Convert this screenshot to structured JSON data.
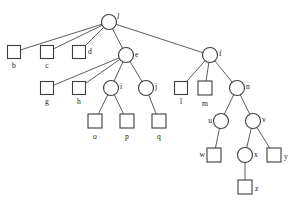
{
  "diagram": {
    "type": "tree-diagram",
    "canvas": {
      "width": 295,
      "height": 201
    },
    "style": {
      "background": "#ffffff",
      "edge_color": "#4a4a4a",
      "node_stroke": "#3d3d3d",
      "node_fill": "#ffffff",
      "label_color": "#1a1a1a"
    },
    "nodes": [
      {
        "id": "a",
        "label": "l",
        "shape": "circle",
        "x": 109,
        "y": 22,
        "r": 7.5,
        "label_pos": "right",
        "label_dx": 8,
        "label_dy": -5,
        "italic": true
      },
      {
        "id": "b",
        "label": "b",
        "shape": "square",
        "x": 14,
        "y": 52,
        "s": 13,
        "label_pos": "below",
        "label_dx": 0,
        "label_dy": 13
      },
      {
        "id": "c",
        "label": "c",
        "shape": "square",
        "x": 47,
        "y": 52,
        "s": 13,
        "label_pos": "below",
        "label_dx": 0,
        "label_dy": 13
      },
      {
        "id": "d",
        "label": "d",
        "shape": "square",
        "x": 79,
        "y": 52,
        "s": 13,
        "label_pos": "right",
        "label_dx": 9,
        "label_dy": 0
      },
      {
        "id": "e",
        "label": "e",
        "shape": "circle",
        "x": 126,
        "y": 55,
        "r": 7.5,
        "label_pos": "right",
        "label_dx": 9,
        "label_dy": 0
      },
      {
        "id": "f",
        "label": "f",
        "shape": "circle",
        "x": 210,
        "y": 55,
        "r": 7.5,
        "label_pos": "right",
        "label_dx": 9,
        "label_dy": -1
      },
      {
        "id": "g",
        "label": "g",
        "shape": "square",
        "x": 47,
        "y": 88,
        "s": 13,
        "label_pos": "below",
        "label_dx": 0,
        "label_dy": 13
      },
      {
        "id": "h",
        "label": "h",
        "shape": "square",
        "x": 79,
        "y": 88,
        "s": 13,
        "label_pos": "below",
        "label_dx": 0,
        "label_dy": 13
      },
      {
        "id": "i",
        "label": "i",
        "shape": "circle",
        "x": 111,
        "y": 88,
        "r": 7.5,
        "label_pos": "right",
        "label_dx": 9,
        "label_dy": -1
      },
      {
        "id": "j",
        "label": "j",
        "shape": "circle",
        "x": 146,
        "y": 88,
        "r": 7.5,
        "label_pos": "right",
        "label_dx": 9,
        "label_dy": -1
      },
      {
        "id": "l",
        "label": "l",
        "shape": "square",
        "x": 181,
        "y": 88,
        "s": 13,
        "label_pos": "below",
        "label_dx": 0,
        "label_dy": 13
      },
      {
        "id": "m",
        "label": "m",
        "shape": "square",
        "x": 205,
        "y": 88,
        "s": 14,
        "label_pos": "below",
        "label_dx": 0,
        "label_dy": 14
      },
      {
        "id": "n",
        "label": "n",
        "shape": "circle",
        "x": 237,
        "y": 88,
        "r": 7.5,
        "label_pos": "right",
        "label_dx": 9,
        "label_dy": -1
      },
      {
        "id": "o",
        "label": "o",
        "shape": "square",
        "x": 95,
        "y": 121,
        "s": 14,
        "label_pos": "below",
        "label_dx": 0,
        "label_dy": 14
      },
      {
        "id": "p",
        "label": "p",
        "shape": "square",
        "x": 127,
        "y": 121,
        "s": 14,
        "label_pos": "below",
        "label_dx": 0,
        "label_dy": 14
      },
      {
        "id": "q",
        "label": "q",
        "shape": "square",
        "x": 159,
        "y": 121,
        "s": 14,
        "label_pos": "below",
        "label_dx": 0,
        "label_dy": 14
      },
      {
        "id": "u",
        "label": "u",
        "shape": "circle",
        "x": 221,
        "y": 121,
        "r": 7.5,
        "label_pos": "left",
        "label_dx": -9,
        "label_dy": 0
      },
      {
        "id": "v",
        "label": "v",
        "shape": "circle",
        "x": 253,
        "y": 121,
        "r": 7.5,
        "label_pos": "right",
        "label_dx": 9,
        "label_dy": -1
      },
      {
        "id": "w",
        "label": "w",
        "shape": "square",
        "x": 214,
        "y": 155,
        "s": 14,
        "label_pos": "left",
        "label_dx": -9,
        "label_dy": 0
      },
      {
        "id": "x",
        "label": "x",
        "shape": "circle",
        "x": 245,
        "y": 155,
        "r": 7.5,
        "label_pos": "right",
        "label_dx": 9,
        "label_dy": 0
      },
      {
        "id": "y",
        "label": "y",
        "shape": "square",
        "x": 274,
        "y": 155,
        "s": 14,
        "label_pos": "right",
        "label_dx": 10,
        "label_dy": 2
      },
      {
        "id": "z",
        "label": "z",
        "shape": "square",
        "x": 245,
        "y": 187,
        "s": 14,
        "label_pos": "right",
        "label_dx": 10,
        "label_dy": 2
      }
    ],
    "edges": [
      {
        "from": "a",
        "to": "b"
      },
      {
        "from": "a",
        "to": "c"
      },
      {
        "from": "a",
        "to": "d"
      },
      {
        "from": "a",
        "to": "e"
      },
      {
        "from": "a",
        "to": "f"
      },
      {
        "from": "e",
        "to": "g"
      },
      {
        "from": "e",
        "to": "h"
      },
      {
        "from": "e",
        "to": "i"
      },
      {
        "from": "e",
        "to": "j"
      },
      {
        "from": "i",
        "to": "o"
      },
      {
        "from": "i",
        "to": "p"
      },
      {
        "from": "j",
        "to": "q"
      },
      {
        "from": "f",
        "to": "l"
      },
      {
        "from": "f",
        "to": "m"
      },
      {
        "from": "f",
        "to": "n"
      },
      {
        "from": "n",
        "to": "u"
      },
      {
        "from": "n",
        "to": "v"
      },
      {
        "from": "u",
        "to": "w"
      },
      {
        "from": "v",
        "to": "x"
      },
      {
        "from": "v",
        "to": "y"
      },
      {
        "from": "x",
        "to": "z"
      }
    ]
  }
}
